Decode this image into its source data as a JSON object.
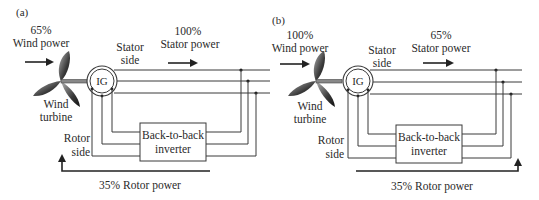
{
  "figure": {
    "panels": [
      {
        "id": "a",
        "label": "(a)",
        "wind_power": {
          "percent": "65%",
          "label": "Wind power"
        },
        "stator_power": {
          "percent": "100%",
          "label": "Stator power"
        },
        "stator_side": {
          "line1": "Stator",
          "line2": "side"
        },
        "turbine": {
          "line1": "Wind",
          "line2": "turbine"
        },
        "generator": "IG",
        "rotor_side": {
          "line1": "Rotor",
          "line2": "side"
        },
        "inverter": {
          "line1": "Back-to-back",
          "line2": "inverter"
        },
        "rotor_power": "35% Rotor power",
        "rotor_power_direction": "toward-rotor"
      },
      {
        "id": "b",
        "label": "(b)",
        "wind_power": {
          "percent": "100%",
          "label": "Wind power"
        },
        "stator_power": {
          "percent": "65%",
          "label": "Stator power"
        },
        "stator_side": {
          "line1": "Stator",
          "line2": "side"
        },
        "turbine": {
          "line1": "Wind",
          "line2": "turbine"
        },
        "generator": "IG",
        "rotor_side": {
          "line1": "Rotor",
          "line2": "side"
        },
        "inverter": {
          "line1": "Back-to-back",
          "line2": "inverter"
        },
        "rotor_power": "35% Rotor power",
        "rotor_power_direction": "toward-grid"
      }
    ],
    "colors": {
      "line": "#3a3a3a",
      "blade_dark": "#2b2b2b",
      "blade_light": "#9a9a9a"
    }
  }
}
